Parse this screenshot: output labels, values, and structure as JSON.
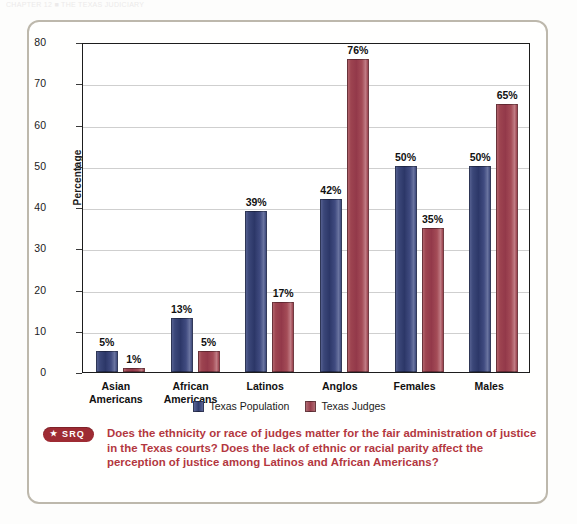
{
  "top_sliver_text": "CHAPTER 12 ■ THE TEXAS JUDICIARY",
  "chart_data": {
    "type": "bar",
    "title": "",
    "xlabel": "",
    "ylabel": "Percentage",
    "ylim": [
      0,
      80
    ],
    "yticks": [
      0,
      10,
      20,
      30,
      40,
      50,
      60,
      70,
      80
    ],
    "grid": true,
    "legend_position": "bottom-center",
    "categories": [
      "Asian\nAmericans",
      "African\nAmericans",
      "Latinos",
      "Anglos",
      "Females",
      "Males"
    ],
    "category_lines": [
      [
        "Asian",
        "Americans"
      ],
      [
        "African",
        "Americans"
      ],
      [
        "Latinos",
        ""
      ],
      [
        "Anglos",
        ""
      ],
      [
        "Females",
        ""
      ],
      [
        "Males",
        ""
      ]
    ],
    "series": [
      {
        "name": "Texas Population",
        "color": "#333d6e",
        "values": [
          5,
          13,
          39,
          42,
          50,
          50
        ],
        "labels": [
          "5%",
          "13%",
          "39%",
          "42%",
          "50%",
          "50%"
        ]
      },
      {
        "name": "Texas Judges",
        "color": "#9b3f4b",
        "values": [
          1,
          5,
          17,
          76,
          35,
          65
        ],
        "labels": [
          "1%",
          "5%",
          "17%",
          "76%",
          "35%",
          "65%"
        ]
      }
    ]
  },
  "legend": {
    "items": [
      {
        "label": "Texas Population",
        "icon": "legend-swatch-blue"
      },
      {
        "label": "Texas Judges",
        "icon": "legend-swatch-red"
      }
    ]
  },
  "srq": {
    "badge_label": "SRQ",
    "badge_star": "★",
    "badge_color": "#9e2b33",
    "text_color": "#b3373f",
    "question": "Does the ethnicity or race of judges matter for the fair administration of justice in the Texas courts? Does the lack of ethnic or racial parity affect the perception of justice among Latinos and African Americans?"
  }
}
